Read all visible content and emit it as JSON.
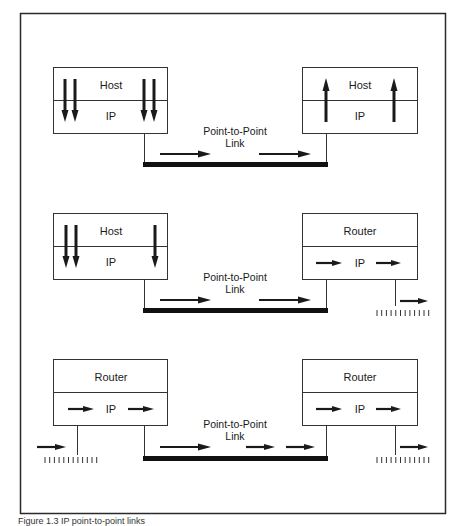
{
  "colors": {
    "ink": "#1a1a1a",
    "background": "#ffffff",
    "frame": "#2a2a2a"
  },
  "link_label": {
    "line1": "Point-to-Point",
    "line2": "Link"
  },
  "scenarios": [
    {
      "id": "host-to-host",
      "left_node": {
        "type": "Host",
        "upper_label": "Host",
        "lower_label": "IP",
        "flow": "down"
      },
      "right_node": {
        "type": "Host",
        "upper_label": "Host",
        "lower_label": "IP",
        "flow": "up"
      },
      "link_label": [
        "Point-to-Point",
        "Link"
      ]
    },
    {
      "id": "host-to-router",
      "left_node": {
        "type": "Host",
        "upper_label": "Host",
        "lower_label": "IP",
        "flow": "down"
      },
      "right_node": {
        "type": "Router",
        "upper_label": "Router",
        "lower_label": "IP",
        "flow": "forward"
      },
      "link_label": [
        "Point-to-Point",
        "Link"
      ]
    },
    {
      "id": "router-to-router",
      "left_node": {
        "type": "Router",
        "upper_label": "Router",
        "lower_label": "IP",
        "flow": "forward"
      },
      "right_node": {
        "type": "Router",
        "upper_label": "Router",
        "lower_label": "IP",
        "flow": "forward"
      },
      "link_label": [
        "Point-to-Point",
        "Link"
      ]
    }
  ],
  "labels": {
    "s1_left_upper": "Host",
    "s1_left_lower": "IP",
    "s1_right_upper": "Host",
    "s1_right_lower": "IP",
    "s1_link_1": "Point-to-Point",
    "s1_link_2": "Link",
    "s2_left_upper": "Host",
    "s2_left_lower": "IP",
    "s2_right_upper": "Router",
    "s2_right_lower": "IP",
    "s2_link_1": "Point-to-Point",
    "s2_link_2": "Link",
    "s3_left_upper": "Router",
    "s3_left_lower": "IP",
    "s3_right_upper": "Router",
    "s3_right_lower": "IP",
    "s3_link_1": "Point-to-Point",
    "s3_link_2": "Link"
  },
  "caption": "Figure 1.3   IP point-to-point links"
}
